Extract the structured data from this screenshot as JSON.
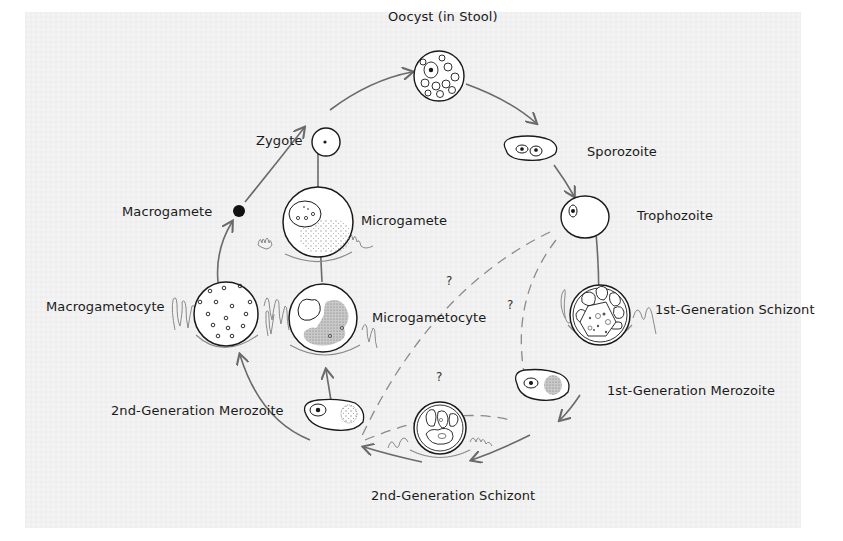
{
  "diagram": {
    "type": "life-cycle",
    "stages": [
      {
        "id": "oocyst",
        "label": "Oocyst (in Stool)"
      },
      {
        "id": "sporozoite",
        "label": "Sporozoite"
      },
      {
        "id": "trophozoite",
        "label": "Trophozoite"
      },
      {
        "id": "schizont1",
        "label": "1st-Generation Schizont"
      },
      {
        "id": "merozoite1",
        "label": "1st-Generation Merozoite"
      },
      {
        "id": "schizont2",
        "label": "2nd-Generation Schizont"
      },
      {
        "id": "merozoite2",
        "label": "2nd-Generation Merozoite"
      },
      {
        "id": "macrogametocyte",
        "label": "Macrogametocyte"
      },
      {
        "id": "microgametocyte",
        "label": "Microgametocyte"
      },
      {
        "id": "macrogamete",
        "label": "Macrogamete"
      },
      {
        "id": "microgamete",
        "label": "Microgamete"
      },
      {
        "id": "zygote",
        "label": "Zygote"
      }
    ],
    "uncertain_marks": [
      "?",
      "?",
      "?"
    ],
    "colors": {
      "background": "#f3f3f3",
      "outline": "#1a1a1a",
      "arrow": "#6a6a6a",
      "dashed": "#8a8a8a",
      "stipple": "#9a9a9a"
    }
  }
}
